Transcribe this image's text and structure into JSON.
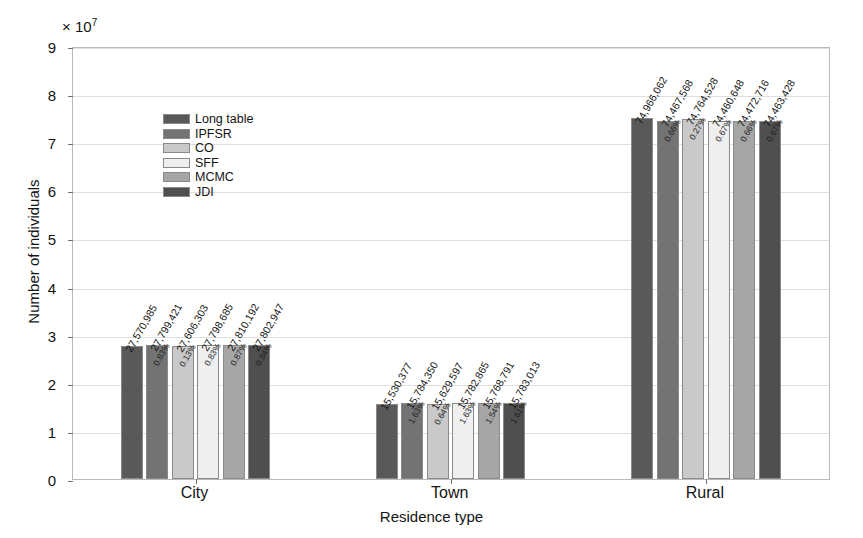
{
  "chart_data": {
    "type": "bar",
    "title": "",
    "xlabel": "Residence type",
    "ylabel": "Number of individuals",
    "y_exponent": "× 10",
    "y_exponent_power": "7",
    "categories": [
      "City",
      "Town",
      "Rural"
    ],
    "ylim": [
      0,
      90000000
    ],
    "yticks": [
      0,
      10000000,
      20000000,
      30000000,
      40000000,
      50000000,
      60000000,
      70000000,
      80000000,
      90000000
    ],
    "ytick_labels": [
      "0",
      "1",
      "2",
      "3",
      "4",
      "5",
      "6",
      "7",
      "8",
      "9"
    ],
    "grid": true,
    "legend_position": "upper-left-inside",
    "series": [
      {
        "name": "Long table",
        "color": "#595959",
        "values": [
          27570985,
          15530377,
          74966062
        ],
        "value_labels": [
          "27,570,985",
          "15,530,377",
          "74,966,062"
        ],
        "pct_labels": [
          "",
          "",
          ""
        ]
      },
      {
        "name": "IPFSR",
        "color": "#737373",
        "values": [
          27799421,
          15784350,
          74467568
        ],
        "value_labels": [
          "27,799,421",
          "15,784,350",
          "74,467,568"
        ],
        "pct_labels": [
          "0.83%",
          "1.63%",
          "0.66%"
        ]
      },
      {
        "name": "CO",
        "color": "#c9c9c9",
        "values": [
          27606303,
          15629597,
          74764528
        ],
        "value_labels": [
          "27,606,303",
          "15,629,597",
          "74,764,528"
        ],
        "pct_labels": [
          "0.13%",
          "0.64%",
          "0.27%"
        ]
      },
      {
        "name": "SFF",
        "color": "#efefef",
        "values": [
          27798685,
          15782865,
          74460648
        ],
        "value_labels": [
          "27,798,685",
          "15,782,865",
          "74,460,648"
        ],
        "pct_labels": [
          "0.83%",
          "1.63%",
          "0.67%"
        ]
      },
      {
        "name": "MCMC",
        "color": "#a6a6a6",
        "values": [
          27810192,
          15768791,
          74472716
        ],
        "value_labels": [
          "27,810,192",
          "15,768,791",
          "74,472,716"
        ],
        "pct_labels": [
          "0.87%",
          "1.54%",
          "0.66%"
        ]
      },
      {
        "name": "JDI",
        "color": "#4f4f4f",
        "values": [
          27802947,
          15783013,
          74463428
        ],
        "value_labels": [
          "27,802,947",
          "15,783,013",
          "74,463,428"
        ],
        "pct_labels": [
          "0.84%",
          "1.61%",
          "0.67%"
        ]
      }
    ]
  }
}
